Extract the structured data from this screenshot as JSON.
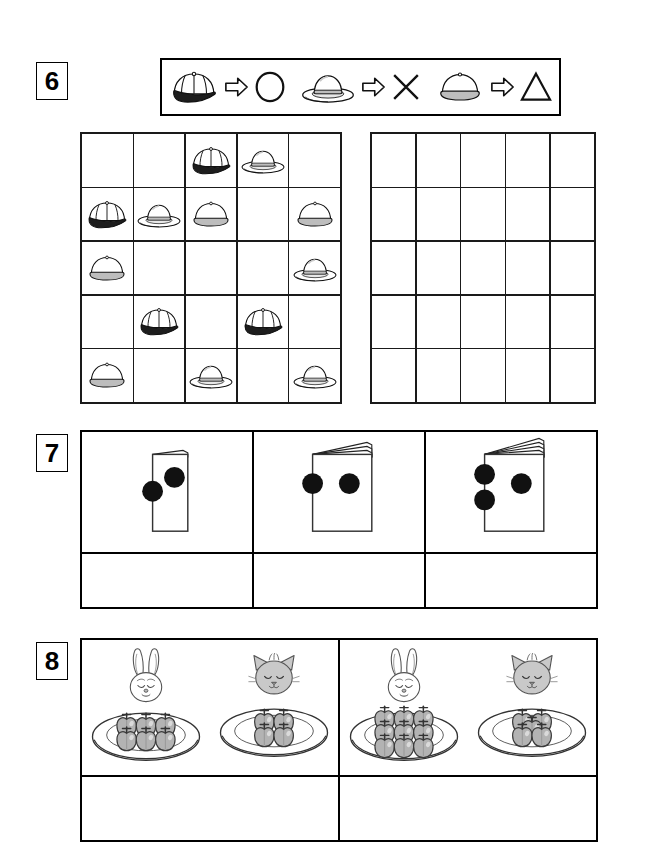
{
  "worksheet": {
    "background_color": "#ffffff",
    "ink_color": "#000000"
  },
  "tasks": [
    {
      "number": "6",
      "type": "symbol-substitution-grid",
      "legend": {
        "label": "hat to symbol key",
        "pairs": [
          {
            "source_icon": "baseball-cap-icon",
            "source_label": "baseball cap",
            "arrow_icon": "arrow-right-icon",
            "result_icon": "circle-icon",
            "result_label": "circle"
          },
          {
            "source_icon": "sun-hat-icon",
            "source_label": "wide brim sun hat",
            "arrow_icon": "arrow-right-icon",
            "result_icon": "cross-icon",
            "result_label": "cross"
          },
          {
            "source_icon": "beanie-hat-icon",
            "source_label": "round beanie hat",
            "arrow_icon": "arrow-right-icon",
            "result_icon": "triangle-icon",
            "result_label": "triangle"
          }
        ]
      },
      "source_grid": {
        "label": "hat grid",
        "rows": 5,
        "cols": 5,
        "cells": [
          [
            "",
            "",
            "cap",
            "sun",
            ""
          ],
          [
            "cap",
            "sun",
            "beanie",
            "",
            "beanie"
          ],
          [
            "beanie",
            "",
            "",
            "",
            "sun"
          ],
          [
            "",
            "cap",
            "",
            "cap",
            ""
          ],
          [
            "beanie",
            "",
            "sun",
            "",
            "sun"
          ]
        ]
      },
      "answer_grid": {
        "label": "answer grid",
        "rows": 5,
        "cols": 5,
        "cells": [
          [
            "",
            "",
            "",
            "",
            ""
          ],
          [
            "",
            "",
            "",
            "",
            ""
          ],
          [
            "",
            "",
            "",
            "",
            ""
          ],
          [
            "",
            "",
            "",
            "",
            ""
          ],
          [
            "",
            "",
            "",
            "",
            ""
          ]
        ]
      }
    },
    {
      "number": "7",
      "type": "book-dot-sequence",
      "items": [
        {
          "icon": "closed-book-icon",
          "page_count": 1,
          "full_dots": 1,
          "edge_dots": 1,
          "width_ratio": 0.42
        },
        {
          "icon": "open-book-icon",
          "page_count": 3,
          "full_dots": 1,
          "edge_dots": 1,
          "width_ratio": 0.78
        },
        {
          "icon": "open-book-icon",
          "page_count": 4,
          "full_dots": 1,
          "edge_dots": 2,
          "width_ratio": 0.78
        }
      ],
      "answer_cells": [
        "",
        "",
        ""
      ]
    },
    {
      "number": "8",
      "type": "compare-quantities",
      "panels": [
        {
          "label": "left panel",
          "pairs": [
            {
              "animal": "bunny-icon",
              "animal_label": "bunny",
              "apple_count": 6,
              "layout": "3x2"
            },
            {
              "animal": "cat-icon",
              "animal_label": "cat",
              "apple_count": 4,
              "layout": "2x2"
            }
          ]
        },
        {
          "label": "right panel",
          "pairs": [
            {
              "animal": "bunny-icon",
              "animal_label": "bunny",
              "apple_count": 9,
              "layout": "3x3"
            },
            {
              "animal": "cat-icon",
              "animal_label": "cat",
              "apple_count": 5,
              "layout": "quincunx"
            }
          ]
        }
      ],
      "answer_cells": [
        "",
        ""
      ]
    }
  ],
  "colors": {
    "apple_fill": "#b3b3b3",
    "cat_fill": "#c9c9c9",
    "hat_band": "#b0b0b0",
    "cap_brim": "#1a1a1a",
    "dot_fill": "#111111"
  }
}
